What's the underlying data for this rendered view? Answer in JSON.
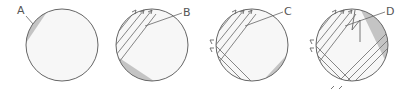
{
  "diagram": {
    "type": "sequence-of-circles",
    "colors": {
      "stroke": "#666666",
      "shade": "#c4c4c4",
      "fill": "#f7f7f7",
      "label": "#555555"
    },
    "panels": [
      {
        "id": "A",
        "label": "A",
        "description": "circle with shaded cap at upper-left"
      },
      {
        "id": "B",
        "label": "B",
        "description": "diagonal arrows entering upper-left; shaded region moves to lower-left"
      },
      {
        "id": "C",
        "label": "C",
        "description": "more crossing arrows; shaded region at lower-right"
      },
      {
        "id": "D",
        "label": "D",
        "description": "dense crossing arrows, zig-zag line; shaded region at upper-right"
      }
    ]
  }
}
